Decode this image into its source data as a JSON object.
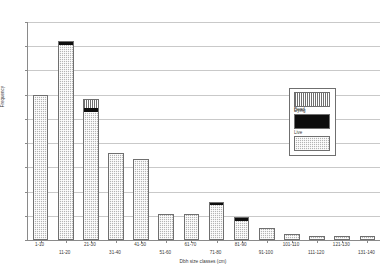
{
  "chart_data": {
    "type": "bar",
    "stacked": true,
    "title": "",
    "xlabel": "Dbh size classes (cm)",
    "ylabel": "Frequency",
    "ylim": [
      0,
      180
    ],
    "ytick_step": 20,
    "yticks": [
      0,
      20,
      40,
      60,
      80,
      100,
      120,
      140,
      160,
      180
    ],
    "grid": true,
    "legend_position": "inside-right",
    "categories": [
      "1-10",
      "11-20",
      "21-30",
      "31-40",
      "41-50",
      "51-60",
      "61-70",
      "71-80",
      "81-90",
      "91-100",
      "101-110",
      "111-120",
      "121-130",
      "131-140"
    ],
    "series": [
      {
        "name": "Live",
        "pattern": "checkered",
        "color": "#b4b4b4",
        "values": [
          118,
          160,
          105,
          70,
          65,
          20,
          20,
          28,
          15,
          8,
          3,
          2,
          2,
          2
        ]
      },
      {
        "name": "Dying",
        "pattern": "solid-black",
        "color": "#0d0d0d",
        "values": [
          0,
          3,
          3,
          0,
          0,
          0,
          0,
          2,
          2,
          0,
          0,
          0,
          0,
          0
        ]
      },
      {
        "name": "Dead",
        "pattern": "vertical-stripes",
        "color": "#ffffff",
        "values": [
          0,
          0,
          7,
          0,
          0,
          0,
          0,
          0,
          0,
          0,
          0,
          0,
          0,
          0
        ]
      }
    ],
    "totals": [
      118,
      163,
      115,
      70,
      65,
      20,
      20,
      30,
      17,
      8,
      3,
      2,
      2,
      2
    ]
  },
  "legend": {
    "entries": [
      {
        "label": "Dead",
        "swatch": "vertical-stripes"
      },
      {
        "label": "Dying",
        "swatch": "solid-black"
      },
      {
        "label": "Live",
        "swatch": "checkered"
      }
    ]
  },
  "axis": {
    "x_title": "Dbh size classes (cm)",
    "y_title": "Frequency"
  },
  "colors": {
    "axis": "#8a8a8a",
    "grid": "#c9c9c9",
    "bar_outline": "#6f6f6f",
    "live": "#b4b4b4",
    "dying": "#0d0d0d",
    "dead": "#ffffff",
    "text": "#3a3a3a",
    "background": "#ffffff"
  }
}
